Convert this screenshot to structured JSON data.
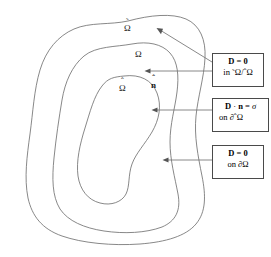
{
  "figure": {
    "type": "nested-domain-diagram",
    "background_color": "#ffffff",
    "curve_color": "#6a6a6a",
    "box_border_color": "#4a4a4a",
    "arrow_color": "#7a7a7a"
  },
  "region_labels": [
    {
      "id": "outer-region",
      "symbol": "Ω",
      "accent": "˜",
      "x": 128,
      "y": 27
    },
    {
      "id": "middle-region",
      "symbol": "Ω",
      "accent": "",
      "x": 138,
      "y": 53
    },
    {
      "id": "inner-region",
      "symbol": "Ω",
      "accent": "ˆ",
      "x": 122,
      "y": 87
    },
    {
      "id": "normal-vector",
      "symbol": "n",
      "accent": "ˆ",
      "x": 153,
      "y": 84
    }
  ],
  "condition_boxes": [
    {
      "id": "box-zero-in-annulus",
      "line1_lhs": "D",
      "line1_op": " = ",
      "line1_rhs": "0",
      "line2": "in Ω̃/Ω̂",
      "line2_prefix": "in ",
      "line2_symbol_a": "Ω",
      "line2_accent_a": "˜",
      "line2_divider": "/",
      "line2_symbol_b": "Ω",
      "line2_accent_b": "ˆ"
    },
    {
      "id": "box-flux-on-inner-boundary",
      "line1_lhs": "D",
      "line1_op": " · ",
      "line1_mid": "n",
      "line1_eq": " = ",
      "line1_rhs": "σ",
      "line2_prefix": "on ∂",
      "line2_symbol": "Ω",
      "line2_accent": "ˆ"
    },
    {
      "id": "box-zero-on-outer-boundary",
      "line1_lhs": "D",
      "line1_op": " = ",
      "line1_rhs": "0",
      "line2_prefix": "on ∂",
      "line2_symbol": "Ω",
      "line2_accent": ""
    }
  ]
}
